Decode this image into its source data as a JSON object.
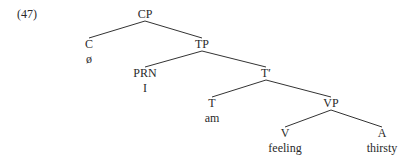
{
  "example_number": "(47)",
  "tree": {
    "nodes": [
      {
        "id": "CP",
        "label": "CP",
        "x": 145,
        "y": 8
      },
      {
        "id": "C",
        "label": "C",
        "x": 89,
        "y": 38,
        "word": "ø"
      },
      {
        "id": "TP",
        "label": "TP",
        "x": 202,
        "y": 38
      },
      {
        "id": "PRN",
        "label": "PRN",
        "x": 145,
        "y": 67,
        "word": "I"
      },
      {
        "id": "Tbar",
        "label": "T′",
        "x": 266,
        "y": 67
      },
      {
        "id": "T",
        "label": "T",
        "x": 212,
        "y": 97,
        "word": "am"
      },
      {
        "id": "VP",
        "label": "VP",
        "x": 331,
        "y": 97
      },
      {
        "id": "V",
        "label": "V",
        "x": 285,
        "y": 127,
        "word": "feeling"
      },
      {
        "id": "A",
        "label": "A",
        "x": 382,
        "y": 127,
        "word": "thirsty"
      }
    ],
    "edges": [
      [
        "CP",
        "C"
      ],
      [
        "CP",
        "TP"
      ],
      [
        "TP",
        "PRN"
      ],
      [
        "TP",
        "Tbar"
      ],
      [
        "Tbar",
        "T"
      ],
      [
        "Tbar",
        "VP"
      ],
      [
        "VP",
        "V"
      ],
      [
        "VP",
        "A"
      ]
    ]
  }
}
